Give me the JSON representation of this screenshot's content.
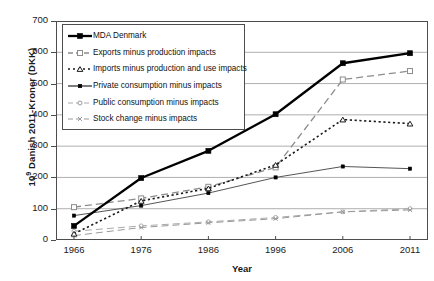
{
  "chart_data": {
    "type": "line",
    "title": "",
    "xlabel": "Year",
    "ylabel": "10⁹ Danish 2011-Kroner (DKK)",
    "ylabel_prefix": "10",
    "ylabel_exponent": "9",
    "ylabel_suffix": " Danish 2011-Kroner (DKK)",
    "x": [
      1966,
      1976,
      1986,
      1996,
      2006,
      2011
    ],
    "categories": [
      "1966",
      "1976",
      "1986",
      "1996",
      "2006",
      "2011"
    ],
    "xtick_labels": [
      "1966",
      "1976",
      "1986",
      "1996",
      "2006",
      "2011"
    ],
    "ytick_labels": [
      "0",
      "100",
      "200",
      "300",
      "400",
      "500",
      "600",
      "700"
    ],
    "yticks": [
      0,
      100,
      200,
      300,
      400,
      500,
      600,
      700
    ],
    "ylim": [
      0,
      700
    ],
    "xlim": [
      1961,
      2016
    ],
    "grid": "horizontal",
    "legend_position": "upper-left-inside",
    "series": [
      {
        "name": "MDA Denmark",
        "values": [
          45,
          198,
          285,
          402,
          565,
          597
        ],
        "marker": "filled-square",
        "line": "solid",
        "color": "#000000",
        "width": 2.3,
        "marker_size": 5
      },
      {
        "name": "Exports minus production impacts",
        "values": [
          105,
          133,
          170,
          232,
          513,
          540
        ],
        "marker": "open-square",
        "line": "dashed",
        "color": "#8c8c8c",
        "width": 1.3,
        "marker_size": 5
      },
      {
        "name": "Imports minus production and use impacts",
        "values": [
          20,
          125,
          165,
          240,
          385,
          372
        ],
        "marker": "open-triangle",
        "line": "dotted",
        "color": "#1a1a1a",
        "width": 1.6,
        "marker_size": 5
      },
      {
        "name": "Private consumption minus impacts",
        "values": [
          78,
          110,
          150,
          200,
          235,
          228
        ],
        "marker": "small-filled-square",
        "line": "solid",
        "color": "#555555",
        "width": 1.0,
        "marker_size": 3.2
      },
      {
        "name": "Public consumption minus impacts",
        "values": [
          28,
          45,
          58,
          72,
          90,
          100
        ],
        "marker": "open-circle",
        "line": "dashed",
        "color": "#aaaaaa",
        "width": 1.0,
        "marker_size": 4
      },
      {
        "name": "Stock change minus impacts",
        "values": [
          14,
          40,
          55,
          68,
          90,
          96
        ],
        "marker": "cross-x",
        "line": "dashed",
        "color": "#999999",
        "width": 1.0,
        "marker_size": 4
      }
    ]
  },
  "legend": {
    "items": [
      {
        "label": "MDA Denmark",
        "marker": "filled-square"
      },
      {
        "label": "Exports minus production impacts",
        "marker": "open-square"
      },
      {
        "label": "Imports minus production and use impacts",
        "marker": "open-triangle"
      },
      {
        "label": "Private consumption minus impacts",
        "marker": "small-filled-square"
      },
      {
        "label": "Public consumption minus impacts",
        "marker": "open-circle"
      },
      {
        "label": "Stock change minus impacts",
        "marker": "cross-x"
      }
    ]
  }
}
